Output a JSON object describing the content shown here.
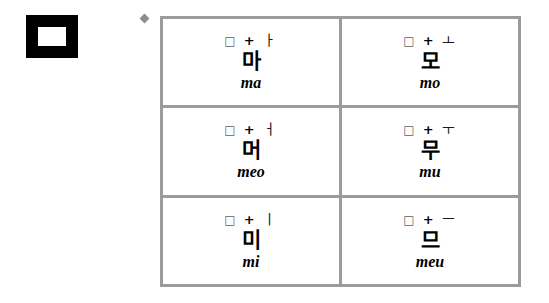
{
  "figure": {
    "consonant_glyph": "ㅁ",
    "consonant_name": "mieum"
  },
  "bullet": {
    "marker": "diamond-bullet"
  },
  "colors": {
    "table_border": "#9b9b9b",
    "bullet": "#8d8d8d",
    "glyph_block": "#000000",
    "background": "#ffffff",
    "text": "#000000"
  },
  "table": {
    "rows": [
      [
        {
          "consonant": "□",
          "operator": "+",
          "vowel": "ㅏ",
          "syllable": "마",
          "romanization": "ma"
        },
        {
          "consonant": "□",
          "operator": "+",
          "vowel": "ㅗ",
          "syllable": "모",
          "romanization": "mo"
        }
      ],
      [
        {
          "consonant": "□",
          "operator": "+",
          "vowel": "ㅓ",
          "syllable": "머",
          "romanization": "meo"
        },
        {
          "consonant": "□",
          "operator": "+",
          "vowel": "ㅜ",
          "syllable": "무",
          "romanization": "mu"
        }
      ],
      [
        {
          "consonant": "□",
          "operator": "+",
          "vowel": "ㅣ",
          "syllable": "미",
          "romanization": "mi"
        },
        {
          "consonant": "□",
          "operator": "+",
          "vowel": "ㅡ",
          "syllable": "므",
          "romanization": "meu"
        }
      ]
    ]
  }
}
